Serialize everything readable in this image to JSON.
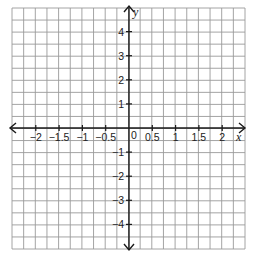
{
  "chart_data": {
    "type": "coordinate-grid",
    "title": "",
    "xlabel": "x",
    "ylabel": "y",
    "xlim": [
      -2.5,
      2.5
    ],
    "ylim": [
      -5,
      5
    ],
    "grid": true,
    "grid_columns": 20,
    "grid_rows": 20,
    "x_ticks": [
      -2,
      -1.5,
      -1,
      -0.5,
      0.5,
      1,
      1.5,
      2
    ],
    "x_tick_labels": [
      "−2",
      "−1.5",
      "−1",
      "−0.5",
      "0.5",
      "1",
      "1.5",
      "2"
    ],
    "y_ticks": [
      4,
      3,
      2,
      1,
      -1,
      -2,
      -3,
      -4
    ],
    "y_tick_labels": [
      "4",
      "3",
      "2",
      "1",
      "−1",
      "−2",
      "−3",
      "−4"
    ],
    "origin_label": "0",
    "series": [],
    "legend": null,
    "colors": {
      "grid": "#9a9a9a",
      "axis": "#1a1a1a",
      "text": "#222222",
      "background": "#ffffff"
    }
  }
}
